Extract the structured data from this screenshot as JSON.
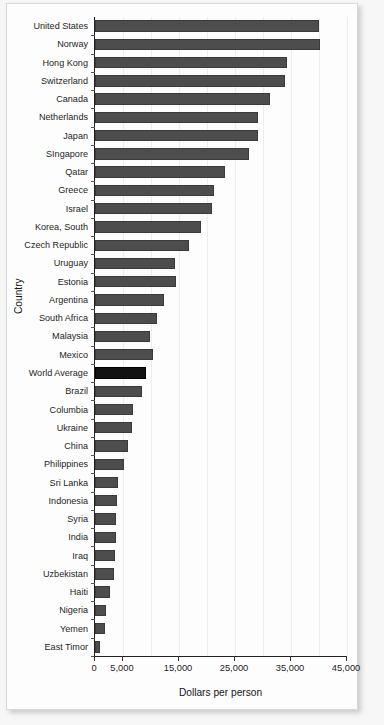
{
  "chart_data": {
    "type": "bar",
    "orientation": "horizontal",
    "title": "",
    "xlabel": "Dollars per person",
    "ylabel": "Country",
    "xlim": [
      0,
      45000
    ],
    "xticks": [
      0,
      5000,
      15000,
      25000,
      35000,
      45000
    ],
    "xtick_labels": [
      "0",
      "5,000",
      "15,000",
      "25,000",
      "35,000",
      "45,000"
    ],
    "grid": true,
    "grid_axis": "x",
    "legend": "none",
    "bar_color": "#4d4d4d",
    "highlight_color": "#121212",
    "highlight_category": "World Average",
    "categories": [
      "United States",
      "Norway",
      "Hong Kong",
      "Switzerland",
      "Canada",
      "Netherlands",
      "Japan",
      "SIngapore",
      "Qatar",
      "Greece",
      "Israel",
      "Korea, South",
      "Czech Republic",
      "Uruguay",
      "Estonia",
      "Argentina",
      "South Africa",
      "Malaysia",
      "Mexico",
      "World Average",
      "Brazil",
      "Columbia",
      "Ukraine",
      "China",
      "Philippines",
      "Sri Lanka",
      "Indonesia",
      "Syria",
      "India",
      "Iraq",
      "Uzbekistan",
      "Haiti",
      "Nigeria",
      "Yemen",
      "East Timor"
    ],
    "values": [
      40000,
      40100,
      34300,
      34000,
      31300,
      29100,
      29100,
      27500,
      23200,
      21300,
      20900,
      18900,
      16800,
      14300,
      14500,
      12300,
      11100,
      9800,
      10400,
      9100,
      8400,
      6800,
      6600,
      5900,
      5200,
      4100,
      3900,
      3700,
      3700,
      3600,
      3400,
      2700,
      2000,
      1800,
      900
    ]
  }
}
